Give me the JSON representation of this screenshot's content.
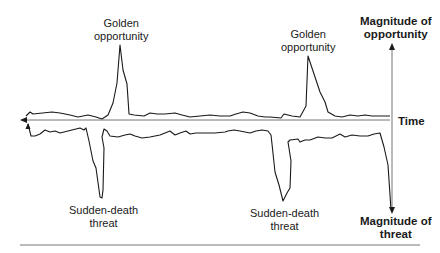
{
  "diagram": {
    "labels": {
      "golden_opportunity_1": [
        "Golden",
        "opportunity"
      ],
      "golden_opportunity_2": [
        "Golden",
        "opportunity"
      ],
      "sudden_death_1": [
        "Sudden-death",
        "threat"
      ],
      "sudden_death_2": [
        "Sudden-death",
        "threat"
      ],
      "axis_up": [
        "Magnitude of",
        "opportunity"
      ],
      "axis_down": [
        "Magnitude of",
        "threat"
      ],
      "axis_time": "Time"
    },
    "colors": {
      "line": "#1a1a1a",
      "axis": "#555555",
      "divider": "#666666",
      "background": "#ffffff"
    },
    "opportunity_line_points": "26,116 30,112 33,114 52,112 60,113 70,115 78,117 88,115 96,117 102,119 108,115 113,103 117,83 120,45 123,70 127,84 129,114 134,115 144,116 150,113 157,114 165,114 175,113 182,115 190,117 200,116 210,115 220,116 230,116 236,114 243,112 250,113 258,116 265,117 270,117 281,118 284,114 292,116 300,117 306,106 308,56 312,68 316,80 320,92 325,102 328,112 335,116 342,117 350,115 358,116 365,115 372,116 380,116 390,116",
    "threat_line_points": "28,124 31,136 35,136 40,134 45,130 50,132 55,131 60,133 68,131 80,128 84,130 86,128 89,141 93,161 96,168 100,197 102,198 103,190 104,148 102,137 104,129 107,131 110,136 118,137 125,135 130,134 135,136 142,138 150,137 160,135 170,131 175,135 180,133 186,131 190,134 196,133 205,133 215,133 225,132 228,131 234,130 240,131 250,133 256,131 262,130 268,131 271,135 272,144 275,172 279,185 283,201 287,193 290,188 291,161 288,142 290,140 298,139 300,142 305,140 310,140 318,137 325,138 332,138 340,134 345,137 352,135 360,136 368,136 374,134 380,133 384,147 388,165 391,210"
  }
}
